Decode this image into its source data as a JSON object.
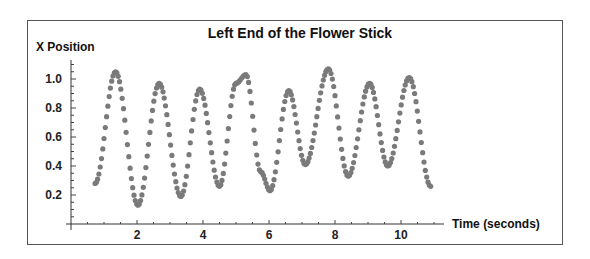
{
  "chart_data": {
    "type": "scatter",
    "title": "Left End of the Flower Stick",
    "xlabel": "Time (seconds)",
    "ylabel": "X Position",
    "xlim": [
      0,
      11.3
    ],
    "ylim": [
      0,
      1.1
    ],
    "x_ticks": [
      2,
      4,
      6,
      8,
      10
    ],
    "x_tick_labels": [
      "2",
      "4",
      "6",
      "8",
      "10"
    ],
    "y_ticks": [
      0.2,
      0.4,
      0.6,
      0.8,
      1.0
    ],
    "y_tick_labels": [
      "0.2",
      "0.4",
      "0.6",
      "0.8",
      "1.0"
    ],
    "grid": false,
    "legend": null,
    "marker_color": "#7a7a7a",
    "series": [
      {
        "name": "Left end x position",
        "key_points": [
          [
            0.73,
            0.28
          ],
          [
            1.35,
            1.05
          ],
          [
            2.03,
            0.13
          ],
          [
            2.67,
            0.97
          ],
          [
            3.33,
            0.19
          ],
          [
            3.9,
            0.93
          ],
          [
            4.5,
            0.26
          ],
          [
            5.0,
            0.97
          ],
          [
            5.3,
            1.03
          ],
          [
            5.75,
            0.36
          ],
          [
            6.03,
            0.23
          ],
          [
            6.6,
            0.92
          ],
          [
            7.1,
            0.41
          ],
          [
            7.8,
            1.07
          ],
          [
            8.4,
            0.33
          ],
          [
            9.05,
            0.97
          ],
          [
            9.6,
            0.4
          ],
          [
            10.25,
            1.01
          ],
          [
            10.9,
            0.26
          ]
        ]
      }
    ]
  }
}
